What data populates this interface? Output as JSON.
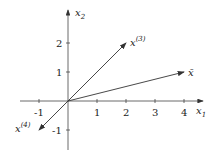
{
  "diagram": {
    "x_axis_label": "x",
    "x_axis_sub": "1",
    "y_axis_label": "x",
    "y_axis_sub": "2",
    "x_ticks": [
      "-1",
      "1",
      "2",
      "3",
      "4"
    ],
    "y_ticks": [
      "2",
      "1",
      "-1"
    ],
    "vectors": [
      {
        "name": "x",
        "sup": "(3)",
        "end": [
          2,
          2
        ]
      },
      {
        "name": "x̄",
        "end": [
          4,
          1
        ]
      },
      {
        "name": "x",
        "sup": "(4)",
        "end": [
          -1,
          -1
        ]
      }
    ]
  }
}
